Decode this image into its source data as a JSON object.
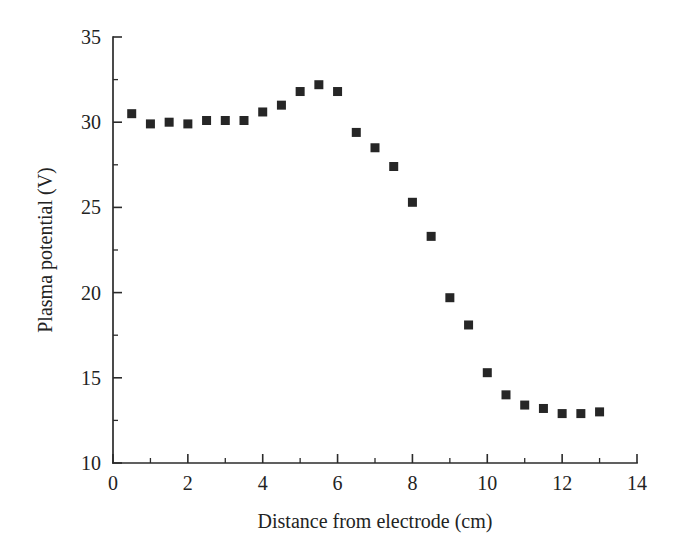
{
  "chart_data": {
    "type": "scatter",
    "title": "",
    "subtitle": "",
    "xlabel": "Distance from electrode (cm)",
    "ylabel": "Plasma potential (V)",
    "xlim": [
      0,
      14
    ],
    "ylim": [
      10,
      35
    ],
    "x_major_ticks": [
      0,
      2,
      4,
      6,
      8,
      10,
      12,
      14
    ],
    "x_minor_ticks": [
      1,
      3,
      5,
      7,
      9,
      11,
      13
    ],
    "y_major_ticks": [
      10,
      15,
      20,
      25,
      30,
      35
    ],
    "y_minor_ticks": [
      12.5,
      17.5,
      22.5,
      27.5,
      32.5
    ],
    "x_tick_labels": [
      "0",
      "2",
      "4",
      "6",
      "8",
      "10",
      "12",
      "14"
    ],
    "y_tick_labels": [
      "10",
      "15",
      "20",
      "25",
      "30",
      "35"
    ],
    "grid": false,
    "legend": false,
    "legend_position": "none",
    "marker_shape": "square",
    "marker_color": "#262626",
    "marker_size": 9,
    "axis_color": "#2b2b2b",
    "background_color": "#ffffff",
    "series": [
      {
        "name": "Plasma potential",
        "x": [
          0.5,
          1.0,
          1.5,
          2.0,
          2.5,
          3.0,
          3.5,
          4.0,
          4.5,
          5.0,
          5.5,
          6.0,
          6.5,
          7.0,
          7.5,
          8.0,
          8.5,
          9.0,
          9.5,
          10.0,
          10.5,
          11.0,
          11.5,
          12.0,
          12.5,
          13.0
        ],
        "values": [
          30.5,
          29.9,
          30.0,
          29.9,
          30.1,
          30.1,
          30.1,
          30.6,
          31.0,
          31.8,
          32.2,
          31.8,
          29.4,
          28.5,
          27.4,
          25.3,
          23.3,
          19.7,
          18.1,
          15.3,
          14.0,
          13.4,
          13.2,
          12.9,
          12.9,
          13.0
        ]
      }
    ]
  },
  "figure": {
    "caption": ""
  }
}
